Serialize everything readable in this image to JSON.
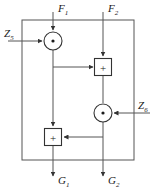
{
  "diagram": {
    "type": "signal-flow-graph",
    "title": "",
    "frame": {
      "name": "outer-boundary",
      "x": 22,
      "y": 20,
      "width": 112,
      "height": 140,
      "stroke": "#555555"
    },
    "style": {
      "line_color": "#555555",
      "node_stroke": "#333333",
      "text_color": "#1a1a1a",
      "background": "#ffffff"
    },
    "inputs": [
      {
        "id": "F1",
        "base": "F",
        "subscript": "1",
        "label": "F₁",
        "x": 53,
        "side": "top"
      },
      {
        "id": "F2",
        "base": "F",
        "subscript": "2",
        "label": "F₂",
        "x": 103,
        "side": "top"
      },
      {
        "id": "Z5",
        "base": "Z",
        "subscript": "5",
        "label": "Z₅",
        "y": 41,
        "side": "left"
      },
      {
        "id": "Z6",
        "base": "Z",
        "subscript": "6",
        "label": "Z₆",
        "y": 113,
        "side": "right"
      }
    ],
    "outputs": [
      {
        "id": "G1",
        "base": "G",
        "subscript": "1",
        "label": "G₁",
        "x": 53,
        "side": "bottom"
      },
      {
        "id": "G2",
        "base": "G",
        "subscript": "2",
        "label": "G₂",
        "x": 103,
        "side": "bottom"
      }
    ],
    "nodes": [
      {
        "id": "mul-top-left",
        "kind": "multiplier",
        "shape": "circle",
        "glyph": "·",
        "cx": 53,
        "cy": 41,
        "r": 9
      },
      {
        "id": "add-top-right",
        "kind": "adder",
        "shape": "square",
        "glyph": "+",
        "cx": 103,
        "cy": 67,
        "size": 17
      },
      {
        "id": "mul-bottom-right",
        "kind": "multiplier",
        "shape": "circle",
        "glyph": "·",
        "cx": 103,
        "cy": 113,
        "r": 9
      },
      {
        "id": "add-bottom-left",
        "kind": "adder",
        "shape": "square",
        "glyph": "+",
        "cx": 53,
        "cy": 137,
        "size": 17
      }
    ],
    "edges": [
      {
        "from": "F1",
        "to": "mul-top-left",
        "orientation": "vertical"
      },
      {
        "from": "Z5",
        "to": "mul-top-left",
        "orientation": "horizontal"
      },
      {
        "from": "mul-top-left",
        "to": "add-bottom-left",
        "orientation": "vertical"
      },
      {
        "from": "left-column-tap",
        "to": "add-top-right",
        "orientation": "horizontal"
      },
      {
        "from": "F2",
        "to": "add-top-right",
        "orientation": "vertical"
      },
      {
        "from": "add-top-right",
        "to": "mul-bottom-right",
        "orientation": "vertical"
      },
      {
        "from": "Z6",
        "to": "mul-bottom-right",
        "orientation": "horizontal"
      },
      {
        "from": "right-column-tap",
        "to": "add-bottom-left",
        "orientation": "horizontal"
      },
      {
        "from": "add-bottom-left",
        "to": "G1",
        "orientation": "vertical"
      },
      {
        "from": "mul-bottom-right",
        "to": "G2",
        "orientation": "vertical"
      }
    ]
  }
}
